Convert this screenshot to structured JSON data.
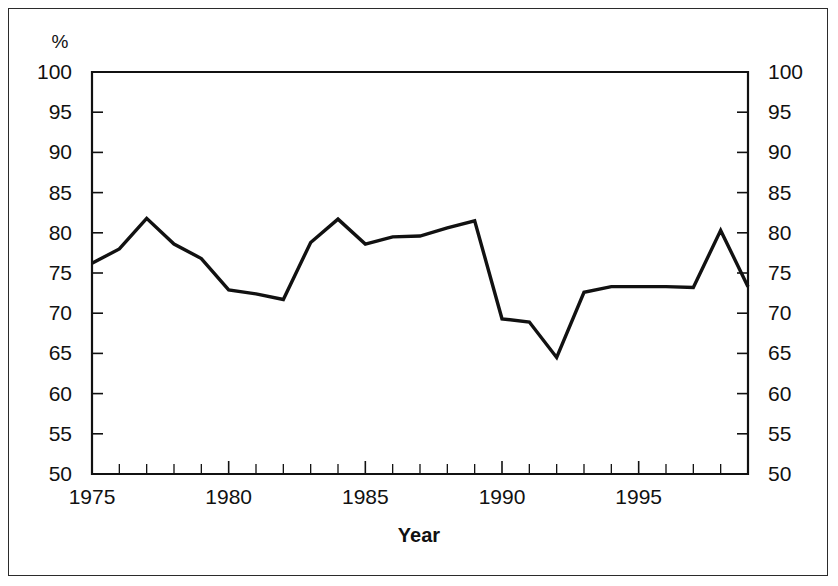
{
  "chart_data": {
    "type": "line",
    "title": "",
    "xlabel": "Year",
    "ylabel": "",
    "yunit": "%",
    "xlim": [
      1975,
      1999
    ],
    "ylim": [
      50,
      100
    ],
    "grid": false,
    "legend": "none",
    "x": [
      1975,
      1976,
      1977,
      1978,
      1979,
      1980,
      1981,
      1982,
      1983,
      1984,
      1985,
      1986,
      1987,
      1988,
      1989,
      1990,
      1991,
      1992,
      1993,
      1994,
      1995,
      1996,
      1997,
      1998,
      1999
    ],
    "series": [
      {
        "name": "percent",
        "color": "#111111",
        "values": [
          76.2,
          78.0,
          81.8,
          78.6,
          76.8,
          72.9,
          72.4,
          71.7,
          78.8,
          81.7,
          78.6,
          79.5,
          79.6,
          80.6,
          81.5,
          69.3,
          68.9,
          64.5,
          72.6,
          73.3,
          73.3,
          73.3,
          73.2,
          80.3,
          73.3
        ]
      }
    ],
    "y_ticks": [
      50,
      55,
      60,
      65,
      70,
      75,
      80,
      85,
      90,
      95,
      100
    ],
    "y_tick_labels_left": [
      "50",
      "55",
      "60",
      "65",
      "70",
      "75",
      "80",
      "85",
      "90",
      "95",
      "100"
    ],
    "y_tick_labels_right": [
      "50",
      "55",
      "60",
      "65",
      "70",
      "75",
      "80",
      "85",
      "90",
      "95",
      "100"
    ],
    "x_ticks_major": [
      1975,
      1980,
      1985,
      1990,
      1995
    ],
    "x_tick_labels": [
      "1975",
      "1980",
      "1985",
      "1990",
      "1995"
    ],
    "x_ticks_minor": [
      1976,
      1977,
      1978,
      1979,
      1981,
      1982,
      1983,
      1984,
      1986,
      1987,
      1988,
      1989,
      1991,
      1992,
      1993,
      1994,
      1996,
      1997,
      1998,
      1999
    ]
  },
  "axes": {
    "unit_label": "%",
    "x_axis_title": "Year"
  },
  "colors": {
    "line": "#111111",
    "axis": "#111111",
    "frame": "#2b2b2b",
    "background": "#ffffff"
  }
}
